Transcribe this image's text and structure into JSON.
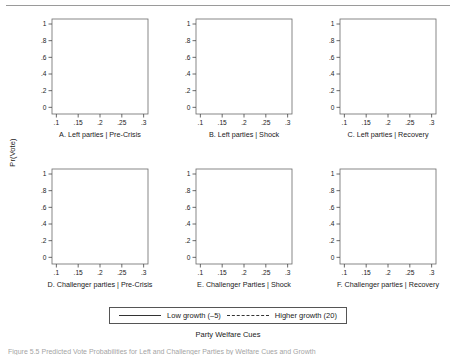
{
  "figure": {
    "ylabel": "Pr(Vote)",
    "xtitle": "Party Welfare Cues",
    "caption": "Figure 5.5  Predicted Vote Probabilities for Left and Challenger Parties by Welfare Cues and Growth"
  },
  "legend": {
    "solid_label": "Low growth (–5)",
    "dashed_label": "Higher growth (20)"
  },
  "axes": {
    "xticks": [
      ".1",
      ".15",
      ".2",
      ".25",
      ".3"
    ],
    "xtickvals": [
      0.1,
      0.15,
      0.2,
      0.25,
      0.3
    ],
    "yticks": [
      "0",
      ".2",
      ".4",
      ".6",
      ".8",
      "1"
    ],
    "ytickvals": [
      0,
      0.2,
      0.4,
      0.6,
      0.8,
      1.0
    ],
    "xlim": [
      0.09,
      0.31
    ],
    "ylim": [
      -0.08,
      1.06
    ]
  },
  "colors": {
    "band_fill": "#d8d8d8",
    "band_edge": "#9b9b9b",
    "line": "#2b2b2b",
    "frame": "#6a6a6a"
  },
  "chart_data": {
    "type": "line",
    "title": "",
    "xlabel": "Party Welfare Cues",
    "ylabel": "Pr(Vote)",
    "xlim": [
      0.09,
      0.31
    ],
    "ylim": [
      -0.08,
      1.06
    ],
    "grid": false,
    "legend_position": "bottom",
    "x": [
      0.1,
      0.15,
      0.2,
      0.25,
      0.3
    ],
    "panels": [
      {
        "id": "A",
        "title": "A. Left parties | Pre-Crisis",
        "series": [
          {
            "name": "Low growth (–5)",
            "style": "solid",
            "values": [
              0.5,
              0.38,
              0.25,
              0.15,
              0.09
            ],
            "lower": [
              0.37,
              0.32,
              0.2,
              0.11,
              0.04
            ],
            "upper": [
              0.6,
              0.45,
              0.31,
              0.2,
              0.15
            ]
          },
          {
            "name": "Higher growth (20)",
            "style": "dashed",
            "values": [
              0.41,
              0.51,
              0.6,
              0.68,
              0.74
            ],
            "lower": [
              0.34,
              0.47,
              0.56,
              0.62,
              0.65
            ],
            "upper": [
              0.49,
              0.56,
              0.65,
              0.74,
              0.83
            ]
          }
        ]
      },
      {
        "id": "B",
        "title": "B. Left parties | Shock",
        "series": [
          {
            "name": "Low growth (–5)",
            "style": "solid",
            "values": [
              0.46,
              0.31,
              0.18,
              0.1,
              0.06
            ],
            "lower": [
              0.36,
              0.24,
              0.12,
              0.04,
              0.0
            ],
            "upper": [
              0.55,
              0.39,
              0.25,
              0.17,
              0.13
            ]
          },
          {
            "name": "Higher growth (20)",
            "style": "dashed",
            "values": [
              0.44,
              0.6,
              0.72,
              0.8,
              0.85
            ],
            "lower": [
              0.36,
              0.54,
              0.66,
              0.73,
              0.76
            ],
            "upper": [
              0.54,
              0.68,
              0.8,
              0.9,
              0.96
            ]
          }
        ]
      },
      {
        "id": "C",
        "title": "C. Left parties | Recovery",
        "series": [
          {
            "name": "Low growth (–5)",
            "style": "solid",
            "values": [
              0.4,
              0.46,
              0.52,
              0.57,
              0.61
            ],
            "lower": [
              0.32,
              0.4,
              0.46,
              0.5,
              0.5
            ],
            "upper": [
              0.47,
              0.52,
              0.58,
              0.65,
              0.72
            ]
          },
          {
            "name": "Higher growth (20)",
            "style": "dashed",
            "values": [
              0.26,
              0.21,
              0.17,
              0.13,
              0.1
            ],
            "lower": [
              0.16,
              0.14,
              0.1,
              0.06,
              0.01
            ],
            "upper": [
              0.34,
              0.28,
              0.23,
              0.19,
              0.18
            ]
          }
        ]
      },
      {
        "id": "D",
        "title": "D. Challenger parties | Pre-Crisis",
        "series": [
          {
            "name": "Low growth (–5)",
            "style": "solid",
            "values": [
              0.16,
              0.145,
              0.13,
              0.115,
              0.1
            ],
            "lower": [
              0.12,
              0.11,
              0.1,
              0.085,
              0.06
            ],
            "upper": [
              0.2,
              0.18,
              0.16,
              0.145,
              0.135
            ]
          },
          {
            "name": "Higher growth (20)",
            "style": "dashed",
            "values": [
              0.27,
              0.258,
              0.245,
              0.233,
              0.22
            ],
            "lower": [
              0.22,
              0.215,
              0.205,
              0.19,
              0.165
            ],
            "upper": [
              0.32,
              0.3,
              0.285,
              0.275,
              0.275
            ]
          }
        ]
      },
      {
        "id": "E",
        "title": "E. Challenger Parties | Shock",
        "series": [
          {
            "name": "Low growth (–5)",
            "style": "solid",
            "values": [
              0.16,
              0.145,
              0.13,
              0.115,
              0.1
            ],
            "lower": [
              0.125,
              0.11,
              0.095,
              0.08,
              0.055
            ],
            "upper": [
              0.2,
              0.18,
              0.165,
              0.15,
              0.14
            ]
          },
          {
            "name": "Higher growth (20)",
            "style": "dashed",
            "values": [
              0.27,
              0.258,
              0.245,
              0.233,
              0.22
            ],
            "lower": [
              0.225,
              0.215,
              0.2,
              0.185,
              0.165
            ],
            "upper": [
              0.315,
              0.3,
              0.29,
              0.28,
              0.275
            ]
          }
        ]
      },
      {
        "id": "F",
        "title": "F. Challenger parties | Recovery",
        "series": [
          {
            "name": "Low growth (–5)",
            "style": "solid",
            "values": [
              0.22,
              0.29,
              0.36,
              0.44,
              0.51
            ],
            "lower": [
              0.17,
              0.24,
              0.3,
              0.36,
              0.39
            ],
            "upper": [
              0.27,
              0.34,
              0.43,
              0.53,
              0.66
            ]
          },
          {
            "name": "Higher growth (20)",
            "style": "dashed",
            "values": [
              0.155,
              0.115,
              0.085,
              0.06,
              0.04
            ],
            "lower": [
              0.075,
              0.055,
              0.035,
              0.015,
              -0.015
            ],
            "upper": [
              0.235,
              0.18,
              0.14,
              0.11,
              0.095
            ]
          }
        ]
      }
    ]
  }
}
